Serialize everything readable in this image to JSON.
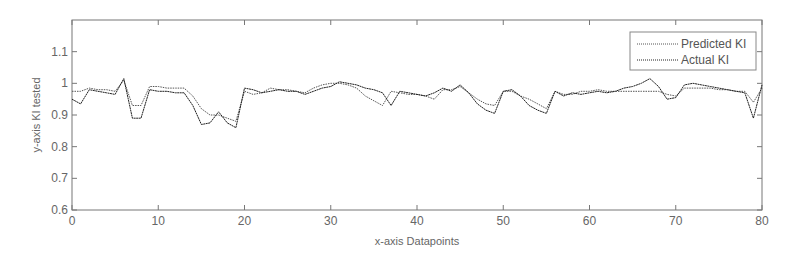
{
  "chart_data": {
    "type": "line",
    "title": "",
    "xlabel": "x-axis Datapoints",
    "ylabel": "y-axis KI tested",
    "xlim": [
      0,
      80
    ],
    "ylim": [
      0.6,
      1.2
    ],
    "xticks": [
      0,
      10,
      20,
      30,
      40,
      50,
      60,
      70,
      80
    ],
    "yticks": [
      0.6,
      0.7,
      0.8,
      0.9,
      1,
      1.1
    ],
    "ytick_labels": [
      "0.6",
      "0.7",
      "0.8",
      "0.9",
      "1",
      "1.1"
    ],
    "grid": false,
    "legend_position": "upper right",
    "x": [
      0,
      1,
      2,
      3,
      4,
      5,
      6,
      7,
      8,
      9,
      10,
      11,
      12,
      13,
      14,
      15,
      16,
      17,
      18,
      19,
      20,
      21,
      22,
      23,
      24,
      25,
      26,
      27,
      28,
      29,
      30,
      31,
      32,
      33,
      34,
      35,
      36,
      37,
      38,
      39,
      40,
      41,
      42,
      43,
      44,
      45,
      46,
      47,
      48,
      49,
      50,
      51,
      52,
      53,
      54,
      55,
      56,
      57,
      58,
      59,
      60,
      61,
      62,
      63,
      64,
      65,
      66,
      67,
      68,
      69,
      70,
      71,
      72,
      73,
      74,
      75,
      76,
      77,
      78,
      79,
      80
    ],
    "series": [
      {
        "name": "Predicted KI",
        "color": "#555555",
        "values": [
          0.975,
          0.975,
          0.985,
          0.98,
          0.98,
          0.975,
          1.01,
          0.93,
          0.93,
          0.99,
          0.99,
          0.985,
          0.985,
          0.985,
          0.96,
          0.92,
          0.9,
          0.9,
          0.89,
          0.88,
          0.975,
          0.965,
          0.97,
          0.985,
          0.98,
          0.98,
          0.975,
          0.97,
          0.985,
          0.995,
          1.0,
          1.0,
          0.995,
          0.985,
          0.96,
          0.945,
          0.93,
          0.975,
          0.97,
          0.965,
          0.965,
          0.96,
          0.95,
          0.98,
          0.98,
          0.99,
          0.97,
          0.95,
          0.935,
          0.93,
          0.975,
          0.975,
          0.96,
          0.95,
          0.935,
          0.92,
          0.975,
          0.965,
          0.965,
          0.975,
          0.975,
          0.98,
          0.975,
          0.975,
          0.975,
          0.975,
          0.975,
          0.975,
          0.975,
          0.965,
          0.96,
          0.985,
          0.985,
          0.985,
          0.985,
          0.98,
          0.98,
          0.975,
          0.975,
          0.94,
          0.985
        ]
      },
      {
        "name": "Actual KI",
        "color": "#222222",
        "values": [
          0.95,
          0.935,
          0.98,
          0.975,
          0.97,
          0.965,
          1.015,
          0.89,
          0.89,
          0.98,
          0.975,
          0.975,
          0.97,
          0.97,
          0.93,
          0.87,
          0.875,
          0.91,
          0.875,
          0.86,
          0.985,
          0.98,
          0.97,
          0.975,
          0.98,
          0.975,
          0.975,
          0.965,
          0.975,
          0.985,
          0.99,
          1.005,
          1.0,
          0.995,
          0.985,
          0.98,
          0.97,
          0.93,
          0.975,
          0.97,
          0.965,
          0.96,
          0.97,
          0.985,
          0.975,
          0.995,
          0.97,
          0.935,
          0.915,
          0.905,
          0.975,
          0.98,
          0.96,
          0.93,
          0.915,
          0.905,
          0.975,
          0.96,
          0.97,
          0.965,
          0.97,
          0.975,
          0.97,
          0.975,
          0.985,
          0.99,
          1.0,
          1.015,
          0.99,
          0.95,
          0.955,
          0.995,
          1.0,
          0.995,
          0.99,
          0.985,
          0.98,
          0.975,
          0.97,
          0.89,
          0.995
        ]
      }
    ]
  },
  "legend": {
    "items": [
      "Predicted KI",
      "Actual KI"
    ]
  }
}
